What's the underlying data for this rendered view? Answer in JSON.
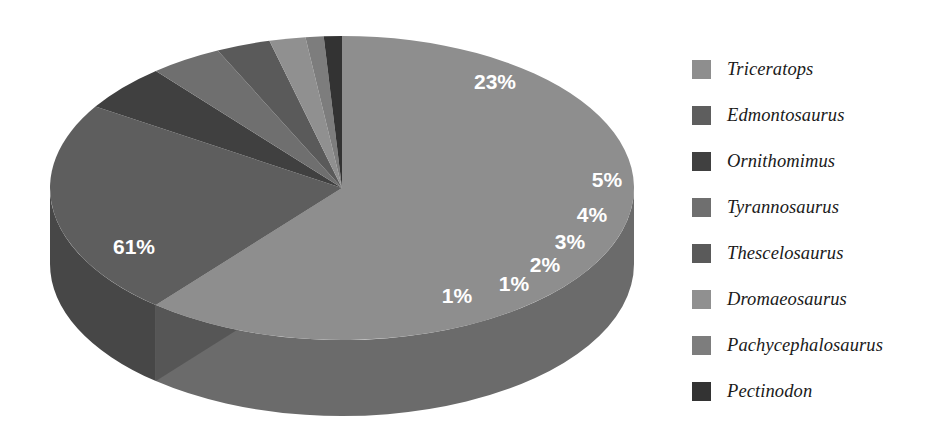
{
  "chart_data": {
    "type": "pie",
    "title": "",
    "subtitle": "",
    "xlabel": "",
    "ylabel": "",
    "three_d": true,
    "grid": false,
    "legend_position": "right",
    "start_angle_deg": 0,
    "direction": "clockwise",
    "value_unit": "percent",
    "categories": [
      "Triceratops",
      "Edmontosaurus",
      "Ornithomimus",
      "Tyrannosaurus",
      "Thescelosaurus",
      "Dromaeosaurus",
      "Pachycephalosaurus",
      "Pectinodon"
    ],
    "values": [
      61,
      23,
      5,
      4,
      3,
      2,
      1,
      1
    ],
    "labels": [
      "61%",
      "23%",
      "5%",
      "4%",
      "3%",
      "2%",
      "1%",
      "1%"
    ],
    "colors": [
      "#8e8e8e",
      "#5e5e5e",
      "#404040",
      "#6f6f6f",
      "#5a5a5a",
      "#909090",
      "#7d7d7d",
      "#333333"
    ],
    "slices": [
      {
        "name": "Triceratops",
        "value": 61,
        "label": "61%",
        "color": "#8e8e8e",
        "side_color": "#6b6b6b",
        "label_x": 134,
        "label_y": 248
      },
      {
        "name": "Edmontosaurus",
        "value": 23,
        "label": "23%",
        "color": "#5e5e5e",
        "side_color": "#474747",
        "label_x": 495,
        "label_y": 83
      },
      {
        "name": "Ornithomimus",
        "value": 5,
        "label": "5%",
        "color": "#404040",
        "side_color": "#303030",
        "label_x": 607,
        "label_y": 181
      },
      {
        "name": "Tyrannosaurus",
        "value": 4,
        "label": "4%",
        "color": "#6f6f6f",
        "side_color": "#545454",
        "label_x": 592,
        "label_y": 216
      },
      {
        "name": "Thescelosaurus",
        "value": 3,
        "label": "3%",
        "color": "#5a5a5a",
        "side_color": "#444444",
        "label_x": 570,
        "label_y": 243
      },
      {
        "name": "Dromaeosaurus",
        "value": 2,
        "label": "2%",
        "color": "#909090",
        "side_color": "#6d6d6d",
        "label_x": 545,
        "label_y": 266
      },
      {
        "name": "Pachycephalosaurus",
        "value": 1,
        "label": "1%",
        "color": "#7d7d7d",
        "side_color": "#5f5f5f",
        "label_x": 514,
        "label_y": 285
      },
      {
        "name": "Pectinodon",
        "value": 1,
        "label": "1%",
        "color": "#333333",
        "side_color": "#272727",
        "label_x": 457,
        "label_y": 297
      }
    ]
  },
  "legend": {
    "items": [
      {
        "label": "Triceratops",
        "color": "#8e8e8e"
      },
      {
        "label": "Edmontosaurus",
        "color": "#5e5e5e"
      },
      {
        "label": "Ornithomimus",
        "color": "#404040"
      },
      {
        "label": "Tyrannosaurus",
        "color": "#6f6f6f"
      },
      {
        "label": "Thescelosaurus",
        "color": "#5a5a5a"
      },
      {
        "label": "Dromaeosaurus",
        "color": "#909090"
      },
      {
        "label": "Pachycephalosaurus",
        "color": "#7d7d7d"
      },
      {
        "label": "Pectinodon",
        "color": "#333333"
      }
    ]
  },
  "geometry": {
    "center_x": 342,
    "center_y": 188,
    "radius_x": 292,
    "radius_y": 152,
    "depth": 76
  }
}
